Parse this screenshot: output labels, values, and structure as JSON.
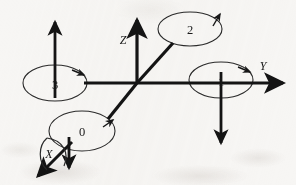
{
  "figure": {
    "background_color": "#f7f6f4",
    "stroke_color": "#1a1a1a"
  },
  "axes": [
    {
      "id": "axis-x",
      "label": "X",
      "direction": "down-left",
      "origin": [
        137,
        83
      ],
      "tip": [
        37,
        178
      ],
      "label_position": [
        47,
        158
      ]
    },
    {
      "id": "axis-y",
      "label": "Y",
      "direction": "right",
      "origin": [
        137,
        83
      ],
      "tip": [
        289,
        83
      ],
      "label_position": [
        262,
        66
      ]
    },
    {
      "id": "axis-z",
      "label": "Z",
      "direction": "up",
      "origin": [
        137,
        83
      ],
      "tip": [
        137,
        14
      ],
      "label_position": [
        122,
        40
      ]
    }
  ],
  "joints": [
    {
      "id": "joint-0",
      "label": "0",
      "center": [
        82,
        131
      ],
      "rx": 33,
      "ry": 20,
      "arrow_at": "right",
      "on_axis": "X"
    },
    {
      "id": "joint-1",
      "label": "1",
      "center": [
        221,
        80
      ],
      "rx": 32,
      "ry": 18,
      "arrow_at": "upper-right",
      "on_axis": "Y"
    },
    {
      "id": "joint-2",
      "label": "2",
      "center": [
        190,
        29
      ],
      "rx": 32,
      "ry": 17,
      "arrow_at": "upper-right",
      "on_axis": "diagonal"
    },
    {
      "id": "joint-3",
      "label": "3",
      "center": [
        55,
        83
      ],
      "rx": 32,
      "ry": 18,
      "arrow_at": "upper-right",
      "on_axis": "Y-negative"
    }
  ],
  "direction_arrows": [
    {
      "id": "arrow-up-joint-3",
      "from": [
        55,
        96
      ],
      "to": [
        55,
        18
      ],
      "direction": "up"
    },
    {
      "id": "arrow-down-joint-1",
      "from": [
        221,
        72
      ],
      "to": [
        221,
        147
      ],
      "direction": "down"
    },
    {
      "id": "arrow-down-origin-x",
      "from": [
        69,
        140
      ],
      "to": [
        69,
        172
      ],
      "direction": "down"
    }
  ],
  "links": [
    {
      "id": "link-center-to-joint-2",
      "from": [
        137,
        83
      ],
      "to": [
        172,
        43
      ]
    },
    {
      "id": "link-center-to-joint-0",
      "from": [
        137,
        83
      ],
      "to": [
        107,
        120
      ]
    }
  ]
}
